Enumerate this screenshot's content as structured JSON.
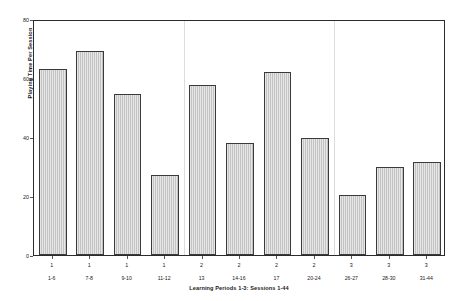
{
  "chart_data": {
    "type": "bar",
    "title": "",
    "xlabel": "Learning Periods 1-3: Sessions 1-44",
    "ylabel": "Playing Time Per Session",
    "ylim": [
      0,
      80
    ],
    "yticks": [
      0,
      20,
      40,
      60,
      80
    ],
    "grid": false,
    "legend": "none",
    "categories": [
      "1-6",
      "7-8",
      "9-10",
      "11-12",
      "13",
      "14-16",
      "17",
      "20-24",
      "26-27",
      "28-30",
      "31-44"
    ],
    "group_labels": [
      "1",
      "1",
      "1",
      "1",
      "2",
      "2",
      "2",
      "2",
      "3",
      "3",
      "3"
    ],
    "values": [
      63,
      69,
      54.5,
      27,
      57.5,
      38,
      62,
      39.5,
      20.5,
      30,
      31.5
    ],
    "group_boundaries_after_index": [
      3,
      7
    ],
    "bar_fill_color": "#c9c9c9",
    "bar_edge_color": "#3a3a3a",
    "axis_color": "#2b2b2b",
    "separator_color": "#dcdcdc"
  }
}
